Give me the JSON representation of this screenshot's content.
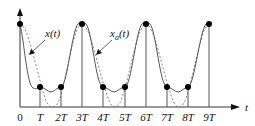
{
  "diagram": {
    "type": "sampled-signal",
    "axis_label": "t",
    "tick_labels": [
      "0",
      "T",
      "2T",
      "3T",
      "4T",
      "5T",
      "6T",
      "7T",
      "8T",
      "9T"
    ],
    "curve_labels": {
      "solid": "x(t)",
      "dashed": "x_a(t)"
    },
    "samples": [
      {
        "n": 0,
        "level": "high"
      },
      {
        "n": 1,
        "level": "low"
      },
      {
        "n": 2,
        "level": "low"
      },
      {
        "n": 3,
        "level": "high"
      },
      {
        "n": 4,
        "level": "low"
      },
      {
        "n": 5,
        "level": "low"
      },
      {
        "n": 6,
        "level": "high"
      },
      {
        "n": 7,
        "level": "low"
      },
      {
        "n": 8,
        "level": "low"
      },
      {
        "n": 9,
        "level": "high"
      }
    ]
  }
}
